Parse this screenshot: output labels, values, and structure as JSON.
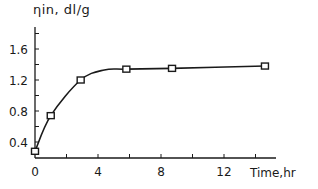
{
  "chart_data": {
    "type": "line",
    "title": "",
    "xlabel": "Time,hr",
    "ylabel": "ηin, dl/g",
    "x_ticks": [
      "0",
      "4",
      "8",
      "12"
    ],
    "y_ticks": [
      "0.4",
      "0.8",
      "1.2",
      "1.6"
    ],
    "xlim": [
      0,
      15
    ],
    "ylim": [
      0.15,
      1.9
    ],
    "grid": false,
    "legend": null,
    "series": [
      {
        "name": "ηin",
        "marker": "square",
        "x": [
          0,
          1,
          2.9,
          5.8,
          8.7,
          14.6
        ],
        "values": [
          0.28,
          0.74,
          1.2,
          1.34,
          1.35,
          1.38
        ]
      }
    ]
  },
  "labels": {
    "ylabel": "ηin, dl/g",
    "xlabel": "Time,hr"
  }
}
